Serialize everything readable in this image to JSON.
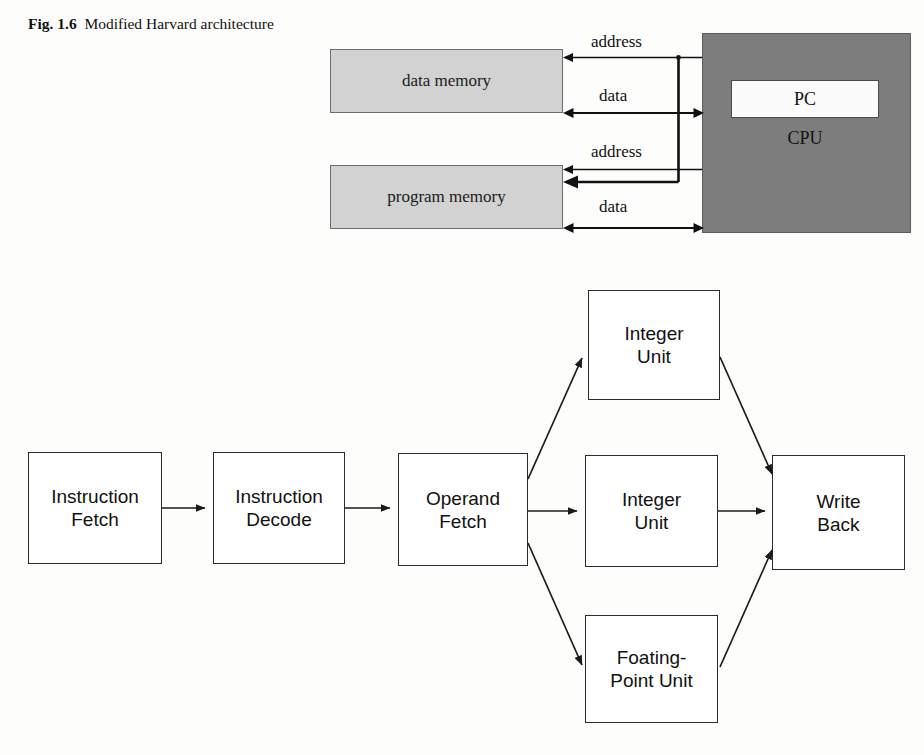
{
  "caption": {
    "label": "Fig. 1.6",
    "text": "Modified Harvard architecture"
  },
  "harvard_diagram": {
    "name": "modified-harvard-architecture",
    "data_memory_label": "data memory",
    "program_memory_label": "program memory",
    "cpu_label": "CPU",
    "pc_label": "PC",
    "bus_labels": {
      "data_address": "address",
      "data_data": "data",
      "program_address": "address",
      "program_data": "data"
    },
    "colors": {
      "memory_fill": "#d2d2d2",
      "memory_border": "#6d6d6d",
      "cpu_fill": "#7d7d7d",
      "pc_fill": "#fbfbfb",
      "line": "#111111"
    }
  },
  "pipeline_diagram": {
    "name": "instruction-pipeline",
    "stages": [
      {
        "id": "instruction-fetch",
        "line1": "Instruction",
        "line2": "Fetch"
      },
      {
        "id": "instruction-decode",
        "line1": "Instruction",
        "line2": "Decode"
      },
      {
        "id": "operand-fetch",
        "line1": "Operand",
        "line2": "Fetch"
      },
      {
        "id": "integer-unit-top",
        "line1": "Integer",
        "line2": "Unit"
      },
      {
        "id": "integer-unit-mid",
        "line1": "Integer",
        "line2": "Unit"
      },
      {
        "id": "floating-point-unit",
        "line1": "Foating-",
        "line2": "Point Unit"
      },
      {
        "id": "write-back",
        "line1": "Write",
        "line2": "Back"
      }
    ],
    "colors": {
      "box_fill": "#ffffff",
      "box_border": "#2b2b2b",
      "arrow": "#1a1a1a"
    }
  },
  "bottom_bleed": {
    "text": ""
  }
}
